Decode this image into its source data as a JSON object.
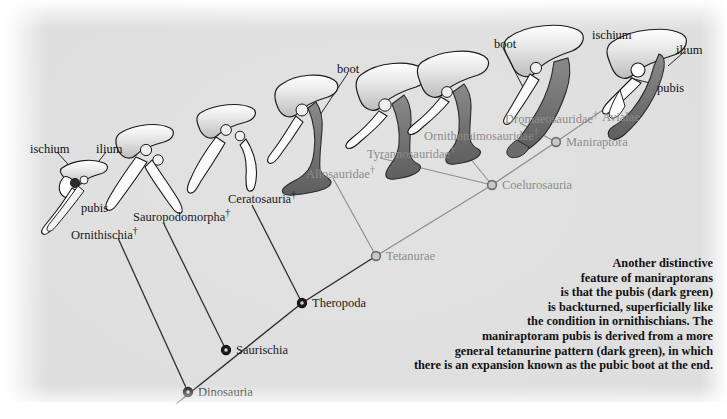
{
  "figure": {
    "type": "cladogram",
    "background_color": "#dedede",
    "node_dark_color": "#1c1c1c",
    "node_gray_color": "#8c8c8c",
    "pubis_color": "#6b6b6b",
    "bone_color": "#f4f4f4"
  },
  "clades": [
    {
      "id": "dinosauria",
      "label": "Dinosauria",
      "dagger": false,
      "style": "dark",
      "node": true,
      "x": 188,
      "y": 392
    },
    {
      "id": "saurischia",
      "label": "Saurischia",
      "dagger": false,
      "style": "dark",
      "node": true,
      "x": 226,
      "y": 350
    },
    {
      "id": "theropoda",
      "label": "Theropoda",
      "dagger": false,
      "style": "dark",
      "node": true,
      "x": 302,
      "y": 303
    },
    {
      "id": "tetanurae",
      "label": "Tetanurae",
      "dagger": false,
      "style": "gray",
      "node": true,
      "x": 376,
      "y": 256
    },
    {
      "id": "coelurosauria",
      "label": "Coelurosauria",
      "dagger": false,
      "style": "gray",
      "node": true,
      "x": 492,
      "y": 185
    },
    {
      "id": "maniraptora",
      "label": "Maniraptora",
      "dagger": false,
      "style": "gray",
      "node": true,
      "x": 556,
      "y": 142
    },
    {
      "id": "ornithischia",
      "label": "Ornithischia",
      "dagger": true,
      "style": "dark",
      "node": false,
      "x": 71,
      "y": 226
    },
    {
      "id": "sauropodomorpha",
      "label": "Sauropodomorpha",
      "dagger": true,
      "style": "dark",
      "node": false,
      "x": 133,
      "y": 208
    },
    {
      "id": "ceratosauria",
      "label": "Ceratosauria",
      "dagger": true,
      "style": "dark",
      "node": false,
      "x": 228,
      "y": 190
    },
    {
      "id": "allosauridae",
      "label": "Allosauridae",
      "dagger": true,
      "style": "gray",
      "node": false,
      "x": 306,
      "y": 165
    },
    {
      "id": "tyrannosauridae",
      "label": "Tyrannosauridae",
      "dagger": true,
      "style": "gray",
      "node": false,
      "x": 367,
      "y": 145
    },
    {
      "id": "ornithomimosauridae",
      "label": "Ornithomimosauridae",
      "dagger": true,
      "style": "gray",
      "node": false,
      "x": 424,
      "y": 127
    },
    {
      "id": "dromaeosauridae",
      "label": "Dromaeosauridae",
      "dagger": true,
      "style": "gray",
      "node": false,
      "x": 505,
      "y": 110
    },
    {
      "id": "avialae",
      "label": "Avialae",
      "dagger": false,
      "style": "gray",
      "node": false,
      "x": 602,
      "y": 111
    }
  ],
  "anatomy_labels": [
    {
      "id": "ischium-left",
      "label": "ischium",
      "x": 30,
      "y": 143
    },
    {
      "id": "ilium-left",
      "label": "ilium",
      "x": 96,
      "y": 143
    },
    {
      "id": "pubis-left",
      "label": "pubis",
      "x": 81,
      "y": 202
    },
    {
      "id": "boot-mid",
      "label": "boot",
      "x": 337,
      "y": 63
    },
    {
      "id": "boot-right",
      "label": "boot",
      "x": 494,
      "y": 38
    },
    {
      "id": "ischium-right",
      "label": "ischium",
      "x": 592,
      "y": 29
    },
    {
      "id": "ilium-right",
      "label": "ilium",
      "x": 676,
      "y": 44
    },
    {
      "id": "pubis-right",
      "label": "pubis",
      "x": 657,
      "y": 82
    }
  ],
  "caption": {
    "lines": [
      "Another distinctive",
      "feature of maniraptorans",
      "is that the pubis (dark green)",
      "is backturned, superficially like",
      "the condition in ornithischians. The",
      "maniraptoram pubis is derived from a more",
      "general tetanurine pattern (dark green), in which",
      "there is an expansion known as the pubic boot at the end."
    ]
  },
  "dagger_symbol": "†"
}
